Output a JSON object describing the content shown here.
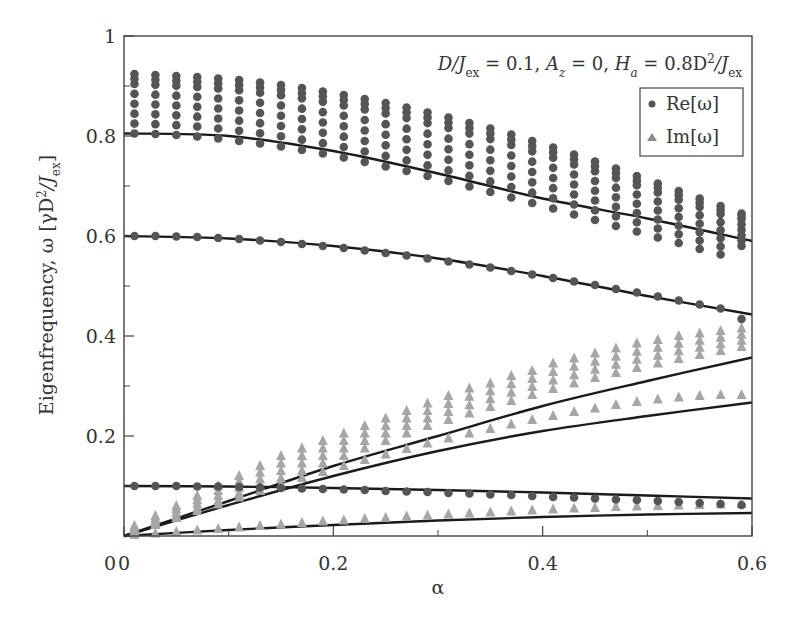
{
  "chart_data": {
    "type": "scatter",
    "title": "",
    "annotation": "D/Jex = 0.1, Az = 0, Ha = 0.8D²/Jex",
    "annotation_parts": {
      "p1": "D/J",
      "p1sub": "ex",
      "p1val": " = 0.1, ",
      "p2": "A",
      "p2sub": "z",
      "p2val": " = 0, ",
      "p3": "H",
      "p3sub": "a",
      "p3val": " = 0.8D",
      "p3sup": "2",
      "p3slash": "/J",
      "p3sub2": "ex"
    },
    "xlabel": "α",
    "ylabel": "Eigenfrequency, ω [γD²/Jex]",
    "ylabel_parts": {
      "main": "Eigenfrequency, ω [γD",
      "sup": "2",
      "slash": "/J",
      "sub": "ex",
      "close": "]"
    },
    "xlim": [
      0,
      0.6
    ],
    "ylim": [
      0,
      1
    ],
    "x_ticks": [
      0,
      0.2,
      0.4,
      0.6
    ],
    "x_tick_labels": [
      "0",
      "0.2",
      "0.4",
      "0.6"
    ],
    "x_minor_ticks": [
      0.1,
      0.3,
      0.5
    ],
    "y_ticks": [
      0.2,
      0.4,
      0.6,
      0.8,
      1
    ],
    "y_tick_labels": [
      "0.2",
      "0.4",
      "0.6",
      "0.8",
      "1"
    ],
    "y_minor_ticks": [
      0.1,
      0.3,
      0.5,
      0.7,
      0.9
    ],
    "grid": false,
    "legend": {
      "position": "upper right",
      "entries": [
        {
          "label": "Re[ω]",
          "marker": "circle",
          "color": "#555555"
        },
        {
          "label": "Im[ω]",
          "marker": "triangle",
          "color": "#a6a6a6"
        }
      ]
    },
    "x": [
      0.01,
      0.03,
      0.05,
      0.07,
      0.09,
      0.11,
      0.13,
      0.15,
      0.17,
      0.19,
      0.21,
      0.23,
      0.25,
      0.27,
      0.29,
      0.31,
      0.33,
      0.35,
      0.37,
      0.39,
      0.41,
      0.43,
      0.45,
      0.47,
      0.49,
      0.51,
      0.53,
      0.55,
      0.57,
      0.59
    ],
    "series": [
      {
        "name": "Re[ω] band (upper cluster, top)",
        "marker": "circle",
        "kind": "points",
        "values": [
          0.924,
          0.922,
          0.92,
          0.918,
          0.915,
          0.912,
          0.907,
          0.902,
          0.896,
          0.889,
          0.882,
          0.874,
          0.866,
          0.857,
          0.847,
          0.837,
          0.826,
          0.815,
          0.803,
          0.79,
          0.777,
          0.763,
          0.749,
          0.735,
          0.72,
          0.705,
          0.69,
          0.675,
          0.66,
          0.645
        ]
      },
      {
        "name": "Re[ω] band (upper cluster, bottom)",
        "marker": "circle",
        "kind": "points",
        "values": [
          0.805,
          0.804,
          0.802,
          0.799,
          0.795,
          0.79,
          0.785,
          0.779,
          0.772,
          0.765,
          0.757,
          0.748,
          0.739,
          0.73,
          0.72,
          0.71,
          0.699,
          0.688,
          0.677,
          0.666,
          0.655,
          0.643,
          0.632,
          0.62,
          0.609,
          0.597,
          0.586,
          0.574,
          0.563,
          0.58
        ]
      },
      {
        "name": "Re[ω] mode 0.6",
        "marker": "circle",
        "kind": "points",
        "values": [
          0.6,
          0.6,
          0.599,
          0.598,
          0.596,
          0.594,
          0.591,
          0.588,
          0.584,
          0.58,
          0.576,
          0.571,
          0.566,
          0.561,
          0.555,
          0.549,
          0.543,
          0.537,
          0.53,
          0.523,
          0.516,
          0.509,
          0.502,
          0.494,
          0.487,
          0.479,
          0.471,
          0.463,
          0.455,
          0.434
        ]
      },
      {
        "name": "Re[ω] mode 0.1",
        "marker": "circle",
        "kind": "points",
        "values": [
          0.1,
          0.1,
          0.1,
          0.099,
          0.099,
          0.098,
          0.097,
          0.096,
          0.095,
          0.094,
          0.093,
          0.092,
          0.09,
          0.089,
          0.088,
          0.086,
          0.085,
          0.083,
          0.082,
          0.08,
          0.078,
          0.077,
          0.075,
          0.073,
          0.072,
          0.07,
          0.068,
          0.066,
          0.064,
          0.062
        ]
      },
      {
        "name": "Im[ω] upper band (top)",
        "marker": "triangle",
        "kind": "points",
        "values": [
          0.02,
          0.04,
          0.06,
          0.08,
          0.1,
          0.12,
          0.14,
          0.16,
          0.175,
          0.19,
          0.205,
          0.22,
          0.235,
          0.25,
          0.265,
          0.28,
          0.295,
          0.305,
          0.32,
          0.33,
          0.345,
          0.355,
          0.365,
          0.375,
          0.385,
          0.392,
          0.4,
          0.405,
          0.41,
          0.415
        ]
      },
      {
        "name": "Im[ω] upper band (bottom)",
        "marker": "triangle",
        "kind": "points",
        "values": [
          0.01,
          0.025,
          0.04,
          0.055,
          0.07,
          0.085,
          0.1,
          0.115,
          0.13,
          0.145,
          0.16,
          0.175,
          0.19,
          0.205,
          0.22,
          0.232,
          0.245,
          0.258,
          0.27,
          0.282,
          0.294,
          0.305,
          0.316,
          0.326,
          0.336,
          0.345,
          0.354,
          0.362,
          0.37,
          0.378
        ]
      },
      {
        "name": "Im[ω] middle mode",
        "marker": "triangle",
        "kind": "points",
        "values": [
          0.008,
          0.022,
          0.036,
          0.05,
          0.063,
          0.077,
          0.09,
          0.103,
          0.116,
          0.128,
          0.14,
          0.152,
          0.163,
          0.174,
          0.185,
          0.195,
          0.205,
          0.214,
          0.223,
          0.232,
          0.24,
          0.248,
          0.255,
          0.262,
          0.268,
          0.273,
          0.277,
          0.28,
          0.282,
          0.282
        ]
      },
      {
        "name": "Im[ω] low mode",
        "marker": "triangle",
        "kind": "points",
        "values": [
          0.002,
          0.005,
          0.008,
          0.011,
          0.014,
          0.017,
          0.02,
          0.023,
          0.026,
          0.029,
          0.031,
          0.034,
          0.036,
          0.039,
          0.041,
          0.043,
          0.045,
          0.047,
          0.049,
          0.051,
          0.053,
          0.055,
          0.056,
          0.058,
          0.059,
          0.06,
          0.061,
          0.062,
          0.063,
          0.064
        ]
      }
    ],
    "curves": [
      {
        "name": "theory Re 0.8",
        "x": [
          0,
          0.1,
          0.2,
          0.3,
          0.4,
          0.5,
          0.6
        ],
        "y": [
          0.805,
          0.8,
          0.77,
          0.725,
          0.675,
          0.635,
          0.59
        ]
      },
      {
        "name": "theory Re 0.6",
        "x": [
          0,
          0.1,
          0.2,
          0.3,
          0.4,
          0.5,
          0.6
        ],
        "y": [
          0.6,
          0.595,
          0.58,
          0.555,
          0.52,
          0.48,
          0.443
        ]
      },
      {
        "name": "theory Re 0.1",
        "x": [
          0,
          0.1,
          0.2,
          0.3,
          0.4,
          0.5,
          0.6
        ],
        "y": [
          0.1,
          0.099,
          0.096,
          0.092,
          0.087,
          0.081,
          0.075
        ]
      },
      {
        "name": "theory Im upper",
        "x": [
          0,
          0.1,
          0.2,
          0.3,
          0.4,
          0.5,
          0.6
        ],
        "y": [
          0,
          0.07,
          0.14,
          0.2,
          0.26,
          0.31,
          0.357
        ]
      },
      {
        "name": "theory Im middle",
        "x": [
          0,
          0.1,
          0.2,
          0.3,
          0.4,
          0.5,
          0.6
        ],
        "y": [
          0,
          0.062,
          0.12,
          0.17,
          0.21,
          0.24,
          0.267
        ]
      },
      {
        "name": "theory Im low",
        "x": [
          0,
          0.1,
          0.2,
          0.3,
          0.4,
          0.5,
          0.6
        ],
        "y": [
          0,
          0.012,
          0.022,
          0.031,
          0.038,
          0.043,
          0.046
        ]
      }
    ],
    "re_band_fill_rows": 7,
    "im_band_fill_rows": 4
  },
  "style": {
    "re_color": "#555555",
    "im_color": "#a6a6a6",
    "curve_color": "#1a1a1a",
    "axis_color": "#444444"
  }
}
